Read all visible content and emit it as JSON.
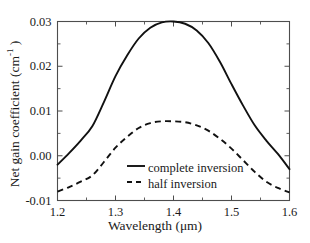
{
  "figure": {
    "background_color": "#ffffff",
    "line_color": "#111111",
    "axis_color": "#4d4d4d"
  },
  "axes": {
    "xlabel": "Wavelength (μm)",
    "ylabel_main": "Net gain coefficient (cm",
    "ylabel_sup": "-1",
    "ylabel_close": " )",
    "xticks": [
      "1.2",
      "1.3",
      "1.4",
      "1.5",
      "1.6"
    ],
    "yticks": [
      "0.03",
      "0.02",
      "0.01",
      "0.00",
      "-0.01"
    ]
  },
  "legend": {
    "entries": [
      {
        "label": "complete inversion",
        "style": "solid"
      },
      {
        "label": "half inversion",
        "style": "dashed"
      }
    ]
  },
  "chart_data": {
    "type": "line",
    "title": "",
    "xlabel": "Wavelength (μm)",
    "ylabel": "Net gain coefficient (cm^-1)",
    "xlim": [
      1.2,
      1.6
    ],
    "ylim": [
      -0.01,
      0.03
    ],
    "xticks": [
      1.2,
      1.3,
      1.4,
      1.5,
      1.6
    ],
    "yticks": [
      -0.01,
      0.0,
      0.01,
      0.02,
      0.03
    ],
    "xminorticks": [
      1.25,
      1.35,
      1.45,
      1.55
    ],
    "yminorticks": [
      -0.005,
      0.005,
      0.015,
      0.025
    ],
    "grid": false,
    "legend_position": "center",
    "series": [
      {
        "name": "complete inversion",
        "style": "solid",
        "x": [
          1.2,
          1.22,
          1.24,
          1.26,
          1.28,
          1.3,
          1.32,
          1.34,
          1.36,
          1.38,
          1.4,
          1.42,
          1.44,
          1.46,
          1.48,
          1.5,
          1.52,
          1.54,
          1.56,
          1.58,
          1.6
        ],
        "values": [
          -0.002,
          0.0006,
          0.0034,
          0.0066,
          0.012,
          0.0178,
          0.0224,
          0.0262,
          0.0286,
          0.0298,
          0.03,
          0.0295,
          0.028,
          0.0252,
          0.021,
          0.016,
          0.0112,
          0.0068,
          0.0034,
          0.0004,
          -0.003
        ]
      },
      {
        "name": "half inversion",
        "style": "dashed",
        "x": [
          1.2,
          1.22,
          1.24,
          1.26,
          1.28,
          1.3,
          1.32,
          1.34,
          1.36,
          1.38,
          1.4,
          1.42,
          1.44,
          1.46,
          1.48,
          1.5,
          1.52,
          1.54,
          1.56,
          1.58,
          1.6
        ],
        "values": [
          -0.008,
          -0.007,
          -0.0058,
          -0.0044,
          -0.0014,
          0.0018,
          0.0042,
          0.0062,
          0.0073,
          0.0077,
          0.0077,
          0.0075,
          0.0068,
          0.0056,
          0.0038,
          0.0016,
          -0.001,
          -0.0036,
          -0.0058,
          -0.0072,
          -0.0082
        ]
      }
    ]
  }
}
